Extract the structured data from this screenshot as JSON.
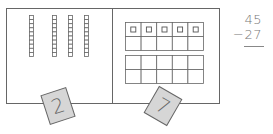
{
  "problem": {
    "minuend": "45",
    "subtrahend": "−27"
  },
  "tens_panel": {
    "rods": 4,
    "cells_per_rod": 10
  },
  "ones_panel": {
    "frames": 2,
    "filled_cells": 5
  },
  "cards": [
    {
      "label": "2"
    },
    {
      "label": "7"
    }
  ],
  "colors": {
    "line": "#555555",
    "card_fill": "#d6d6d6",
    "text": "#777777"
  }
}
